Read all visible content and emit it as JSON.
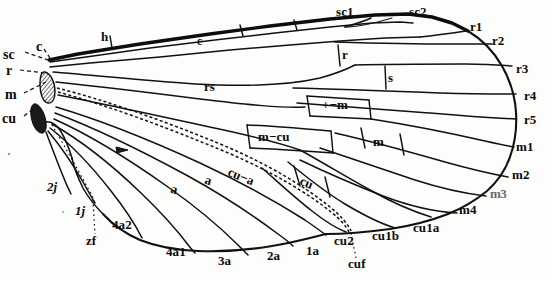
{
  "figure": {
    "background_color": "#fdfdfb",
    "ink_color": "#111111",
    "width": 553,
    "height": 281
  },
  "base_labels": [
    {
      "id": "sc-base",
      "text": "sc",
      "x": 3,
      "y": 52,
      "leader": true
    },
    {
      "id": "c-base",
      "text": "c",
      "x": 36,
      "y": 44,
      "leader": true
    },
    {
      "id": "r-base",
      "text": "r",
      "x": 6,
      "y": 68,
      "leader": true
    },
    {
      "id": "m-base",
      "text": "m",
      "x": 5,
      "y": 92,
      "leader": true
    },
    {
      "id": "cu-base",
      "text": "cu",
      "x": 2,
      "y": 117,
      "leader": true
    }
  ],
  "margin_labels": [
    {
      "id": "h",
      "text": "h",
      "x": 101,
      "y": 35
    },
    {
      "id": "sc1",
      "text": "sc1",
      "x": 336,
      "y": 10
    },
    {
      "id": "sc2",
      "text": "sc2",
      "x": 409,
      "y": 10
    },
    {
      "id": "r1",
      "text": "r1",
      "x": 470,
      "y": 25
    },
    {
      "id": "r2",
      "text": "r2",
      "x": 492,
      "y": 39
    },
    {
      "id": "r3",
      "text": "r3",
      "x": 516,
      "y": 68
    },
    {
      "id": "r4",
      "text": "r4",
      "x": 524,
      "y": 95
    },
    {
      "id": "r5",
      "text": "r5",
      "x": 524,
      "y": 119
    },
    {
      "id": "m1",
      "text": "m1",
      "x": 518,
      "y": 146
    },
    {
      "id": "m2",
      "text": "m2",
      "x": 514,
      "y": 173
    },
    {
      "id": "m3",
      "text": "m3",
      "x": 492,
      "y": 191
    },
    {
      "id": "m4",
      "text": "m4",
      "x": 461,
      "y": 207
    },
    {
      "id": "cu1a",
      "text": "cu1a",
      "x": 415,
      "y": 225
    },
    {
      "id": "cu1b",
      "text": "cu1b",
      "x": 374,
      "y": 233
    },
    {
      "id": "cu2",
      "text": "cu2",
      "x": 336,
      "y": 238
    },
    {
      "id": "1a",
      "text": "1a",
      "x": 307,
      "y": 248
    },
    {
      "id": "2a",
      "text": "2a",
      "x": 268,
      "y": 252
    },
    {
      "id": "3a",
      "text": "3a",
      "x": 219,
      "y": 257
    },
    {
      "id": "4a1",
      "text": "4a1",
      "x": 167,
      "y": 249
    },
    {
      "id": "4a2",
      "text": "4a2",
      "x": 113,
      "y": 222
    },
    {
      "id": "1j",
      "text": "1j",
      "x": 76,
      "y": 208
    },
    {
      "id": "2j",
      "text": "2j",
      "x": 48,
      "y": 184
    }
  ],
  "fold_labels": [
    {
      "id": "zf",
      "text": "zf",
      "x": 87,
      "y": 238
    },
    {
      "id": "cuf",
      "text": "cuf",
      "x": 349,
      "y": 261
    }
  ],
  "cell_labels": [
    {
      "id": "cell-c",
      "text": "c",
      "x": 198,
      "y": 41,
      "boxed": true
    },
    {
      "id": "cell-r",
      "text": "r",
      "x": 344,
      "y": 54,
      "boxed": true
    },
    {
      "id": "cell-s",
      "text": "s",
      "x": 390,
      "y": 77,
      "boxed": true
    },
    {
      "id": "cell-rs",
      "text": "rs",
      "x": 207,
      "y": 85,
      "boxed": false
    },
    {
      "id": "cell-r-m",
      "text": "+−m",
      "x": 327,
      "y": 105,
      "boxed": true
    },
    {
      "id": "cell-m-cu",
      "text": "m−cu",
      "x": 263,
      "y": 137,
      "boxed": true
    },
    {
      "id": "cell-m",
      "text": "m",
      "x": 375,
      "y": 141,
      "boxed": true
    },
    {
      "id": "cell-cu-a",
      "text": "cu−a",
      "x": 239,
      "y": 172,
      "boxed": true
    },
    {
      "id": "cell-cu",
      "text": "cu",
      "x": 305,
      "y": 180,
      "boxed": true
    },
    {
      "id": "cell-a1",
      "text": "a",
      "x": 208,
      "y": 179,
      "boxed": true
    },
    {
      "id": "cell-a2",
      "text": "a",
      "x": 174,
      "y": 188,
      "boxed": true
    }
  ],
  "structures": {
    "costal_margin": "thick anterior vein running from base to apex",
    "basal_sclerites": "two hatched/solid dark blobs at wing base",
    "cu_fold": "dashed line following cubital fold across wing",
    "z_fold": "dotted line in the anal/jugal region",
    "anal_field_arrow": "small solid arrowhead on second anal vein"
  }
}
